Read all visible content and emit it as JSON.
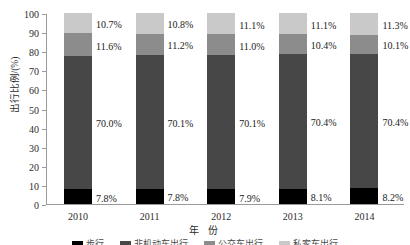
{
  "chart_data": {
    "type": "bar",
    "subtype": "stacked-100-percent",
    "title": "",
    "xlabel": "年 份",
    "ylabel": "出行比例/(%)",
    "ylim": [
      0,
      100
    ],
    "yticks": [
      0,
      10,
      20,
      30,
      40,
      50,
      60,
      70,
      80,
      90,
      100
    ],
    "ytick_labels": [
      "0",
      "10",
      "20",
      "30",
      "40",
      "50",
      "60",
      "70",
      "80",
      "90",
      "100"
    ],
    "categories": [
      "2010",
      "2011",
      "2012",
      "2013",
      "2014"
    ],
    "grid": false,
    "legend_position": "bottom",
    "series": [
      {
        "name": "步行",
        "color": "#000000",
        "values": [
          7.8,
          7.8,
          7.9,
          8.1,
          8.2
        ],
        "labels": [
          "7.8%",
          "7.8%",
          "7.9%",
          "8.1%",
          "8.2%"
        ]
      },
      {
        "name": "非机动车出行",
        "color": "#474747",
        "values": [
          70.0,
          70.1,
          70.1,
          70.4,
          70.4
        ],
        "labels": [
          "70.0%",
          "70.1%",
          "70.1%",
          "70.4%",
          "70.4%"
        ]
      },
      {
        "name": "公交车出行",
        "color": "#8c8c8c",
        "values": [
          11.6,
          11.2,
          11.0,
          10.4,
          10.1
        ],
        "labels": [
          "11.6%",
          "11.2%",
          "11.0%",
          "10.4%",
          "10.1%"
        ]
      },
      {
        "name": "私家车出行",
        "color": "#c9c9c9",
        "values": [
          10.7,
          10.8,
          11.1,
          11.1,
          11.3
        ],
        "labels": [
          "10.7%",
          "10.8%",
          "11.1%",
          "11.1%",
          "11.3%"
        ]
      }
    ]
  },
  "legend": {
    "items": [
      {
        "label": "步行",
        "color": "#000000"
      },
      {
        "label": "非机动车出行",
        "color": "#474747"
      },
      {
        "label": "公交车出行",
        "color": "#8c8c8c"
      },
      {
        "label": "私家车出行",
        "color": "#c9c9c9"
      }
    ]
  }
}
